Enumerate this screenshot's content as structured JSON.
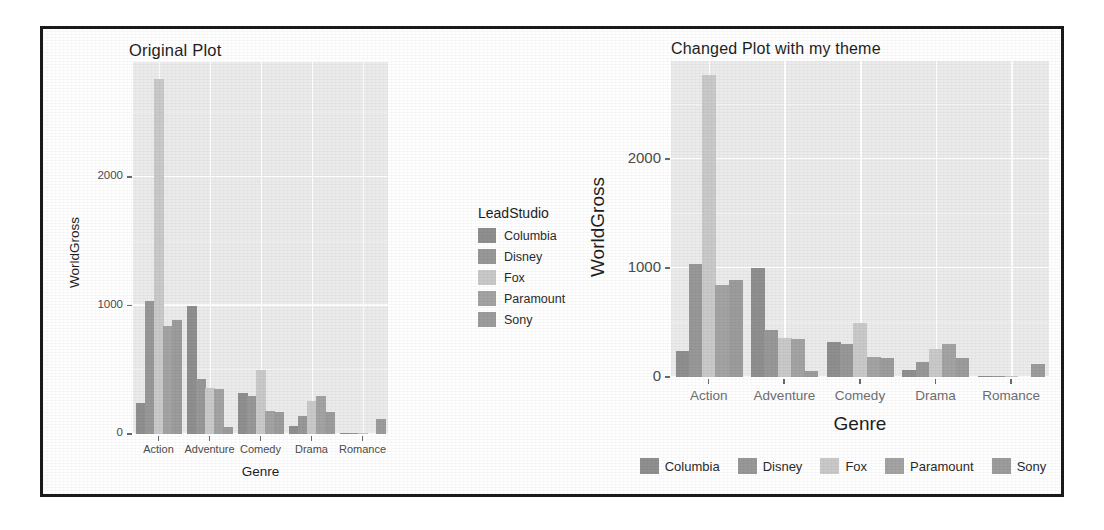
{
  "document": {
    "kind": "scanned-figure-page",
    "frame_border_color": "#1a1a1a",
    "page_background": "#ffffff"
  },
  "palette": {
    "panel_background": "#ebebeb",
    "grid_major": "#ffffff",
    "grid_minor": "#f4f4f4",
    "axis_text": "#4c4c4c",
    "title_text": "#1e1e1e",
    "bar_columbia": "#8f8f8f",
    "bar_disney": "#989898",
    "bar_fox": "#c9c9c9",
    "bar_paramount": "#a3a3a3",
    "bar_sony": "#9c9c9c"
  },
  "chart_data": [
    {
      "id": "original",
      "type": "bar",
      "title": "Original Plot",
      "xlabel": "Genre",
      "ylabel": "WorldGross",
      "categories": [
        "Action",
        "Adventure",
        "Comedy",
        "Drama",
        "Romance"
      ],
      "series": [
        {
          "name": "Columbia",
          "color": "#8f8f8f",
          "values": [
            240,
            1000,
            320,
            60,
            5
          ]
        },
        {
          "name": "Disney",
          "color": "#989898",
          "values": [
            1040,
            430,
            300,
            140,
            10
          ]
        },
        {
          "name": "Fox",
          "color": "#c9c9c9",
          "values": [
            2770,
            360,
            500,
            260,
            5
          ]
        },
        {
          "name": "Paramount",
          "color": "#a3a3a3",
          "values": [
            840,
            350,
            180,
            300,
            0
          ]
        },
        {
          "name": "Sony",
          "color": "#9c9c9c",
          "values": [
            890,
            55,
            175,
            170,
            120
          ]
        }
      ],
      "yticks": [
        0,
        1000,
        2000
      ],
      "ylim": [
        0,
        2900
      ],
      "grid": true,
      "legend": {
        "title": "LeadStudio",
        "position": "right",
        "entries": [
          "Columbia",
          "Disney",
          "Fox",
          "Paramount",
          "Sony"
        ]
      }
    },
    {
      "id": "themed",
      "type": "bar",
      "title": "Changed Plot with my theme",
      "xlabel": "Genre",
      "ylabel": "WorldGross",
      "categories": [
        "Action",
        "Adventure",
        "Comedy",
        "Drama",
        "Romance"
      ],
      "series": [
        {
          "name": "Columbia",
          "color": "#8f8f8f",
          "values": [
            240,
            1000,
            320,
            60,
            5
          ]
        },
        {
          "name": "Disney",
          "color": "#989898",
          "values": [
            1040,
            430,
            300,
            140,
            10
          ]
        },
        {
          "name": "Fox",
          "color": "#c9c9c9",
          "values": [
            2770,
            360,
            500,
            260,
            5
          ]
        },
        {
          "name": "Paramount",
          "color": "#a3a3a3",
          "values": [
            840,
            350,
            180,
            300,
            0
          ]
        },
        {
          "name": "Sony",
          "color": "#9c9c9c",
          "values": [
            890,
            55,
            175,
            170,
            120
          ]
        }
      ],
      "yticks": [
        0,
        1000,
        2000
      ],
      "ylim": [
        0,
        2900
      ],
      "grid": true,
      "legend": {
        "title": "",
        "position": "bottom",
        "entries": [
          "Columbia",
          "Disney",
          "Fox",
          "Paramount",
          "Sony"
        ]
      }
    }
  ]
}
